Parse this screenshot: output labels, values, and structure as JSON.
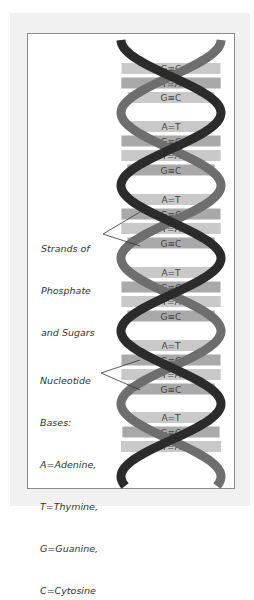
{
  "figure": {
    "colors": {
      "background": "#ffffff",
      "frame": "#f1f1f1",
      "panel_border": "#8a8a8a",
      "strand_dark": "#2b2b2b",
      "strand_medium": "#6e6e6e",
      "bar_light": "#c9c9c9",
      "bar_mid": "#a9a9a9",
      "base_text": "#444444"
    },
    "segments": [
      {
        "pairs": [
          "G≡C",
          "T=A",
          "G≡C"
        ]
      },
      {
        "pairs": [
          "A=T",
          "G≡C",
          "T=A",
          "G≡C"
        ]
      },
      {
        "pairs": [
          "A=T",
          "G≡C",
          "T=A",
          "G≡C"
        ]
      },
      {
        "pairs": [
          "A=T",
          "G≡C",
          "T=A",
          "G≡C"
        ]
      },
      {
        "pairs": [
          "A=T",
          "G≡C",
          "T=A",
          "G≡C"
        ]
      },
      {
        "pairs": [
          "A=T",
          "G≡C",
          "T=A"
        ]
      }
    ],
    "labels": {
      "strands": [
        "Strands of",
        "Phosphate",
        "and Sugars"
      ],
      "bases": [
        "Nucleotide",
        "Bases:",
        "A=Adenine,",
        "T=Thymine,",
        "G=Guanine,",
        "C=Cytosine"
      ]
    }
  }
}
